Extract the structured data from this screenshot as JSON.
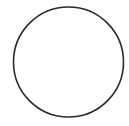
{
  "figure": {
    "background": "#ffffff",
    "shapes": [
      {
        "type": "circle",
        "cx": 68.5,
        "cy": 62,
        "r": 55,
        "stroke": "#2a2a2a",
        "stroke_width": 1.6,
        "fill": "none"
      }
    ]
  }
}
